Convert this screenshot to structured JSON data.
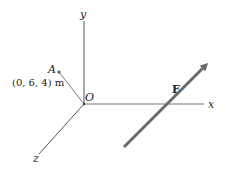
{
  "diagram": {
    "axes": {
      "x_label": "x",
      "y_label": "y",
      "z_label": "z",
      "origin_label": "O"
    },
    "point": {
      "label": "A",
      "coords_label": "(0, 6, 4) m"
    },
    "force": {
      "label": "F"
    },
    "colors": {
      "axis": "#555555",
      "force": "#6b6b6b",
      "text": "#222222"
    }
  }
}
